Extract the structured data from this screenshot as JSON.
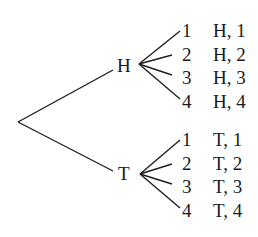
{
  "diagram": {
    "type": "tree",
    "root": {
      "x": 18,
      "y": 122
    },
    "first_stage": [
      {
        "label": "H",
        "label_pos": {
          "x": 117,
          "y": 65
        },
        "edge_end": {
          "x": 113,
          "y": 70
        },
        "vertex": {
          "x": 139,
          "y": 64
        },
        "branches": [
          {
            "number": "1",
            "outcome": "H, 1",
            "end": {
              "x": 180,
              "y": 31
            },
            "y": 30
          },
          {
            "number": "2",
            "outcome": "H, 2",
            "end": {
              "x": 172,
              "y": 55
            },
            "y": 54
          },
          {
            "number": "3",
            "outcome": "H, 3",
            "end": {
              "x": 172,
              "y": 75
            },
            "y": 77
          },
          {
            "number": "4",
            "outcome": "H, 4",
            "end": {
              "x": 180,
              "y": 99
            },
            "y": 101
          }
        ]
      },
      {
        "label": "T",
        "label_pos": {
          "x": 118,
          "y": 173
        },
        "edge_end": {
          "x": 113,
          "y": 171
        },
        "vertex": {
          "x": 140,
          "y": 174
        },
        "branches": [
          {
            "number": "1",
            "outcome": "T, 1",
            "end": {
              "x": 180,
              "y": 140
            },
            "y": 139
          },
          {
            "number": "2",
            "outcome": "T, 2",
            "end": {
              "x": 172,
              "y": 164
            },
            "y": 163
          },
          {
            "number": "3",
            "outcome": "T, 3",
            "end": {
              "x": 172,
              "y": 184
            },
            "y": 186
          },
          {
            "number": "4",
            "outcome": "T, 4",
            "end": {
              "x": 180,
              "y": 208
            },
            "y": 210
          }
        ]
      }
    ],
    "number_x": 182,
    "outcome_x": 213,
    "stroke_color": "#1f1f1f",
    "text_color": "#1a1a1a"
  }
}
